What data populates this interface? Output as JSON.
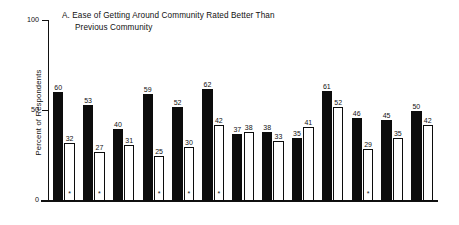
{
  "chart_data": {
    "type": "bar",
    "title": "A.  Ease of Getting Around Community Rated Better Than Previous Community",
    "title_lines": [
      "A.  Ease of Getting Around Community Rated Better Than",
      "Previous Community"
    ],
    "xlabel": "",
    "ylabel": "Percent of Respondents",
    "ylim": [
      0,
      100
    ],
    "ytick_labels": [
      "0",
      "50",
      "100"
    ],
    "ytick_values": [
      0,
      50,
      100
    ],
    "grid": false,
    "legend": "none",
    "categories": [
      "1",
      "2",
      "3",
      "4",
      "5",
      "6",
      "7",
      "8",
      "9",
      "10",
      "11",
      "12",
      "13"
    ],
    "series": [
      {
        "name": "dark",
        "values": [
          60,
          53,
          40,
          59,
          52,
          62,
          37,
          38,
          35,
          61,
          46,
          45,
          50
        ]
      },
      {
        "name": "light",
        "values": [
          32,
          27,
          31,
          25,
          30,
          42,
          38,
          33,
          41,
          52,
          29,
          35,
          42
        ]
      }
    ],
    "annotations": {
      "marker": "*",
      "marker_on_light_bars": [
        1,
        2,
        4,
        5,
        6,
        11
      ],
      "note": "asterisk below light bar of marked pairs"
    },
    "colors": {
      "dark_bar": "#0c0c0c",
      "light_bar": "#ffffff",
      "outline": "#0c0c0c",
      "axis": "#111111",
      "background": "#ffffff"
    }
  }
}
